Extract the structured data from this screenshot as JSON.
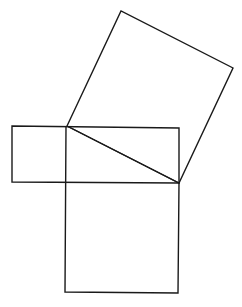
{
  "diagram": {
    "type": "geometric-construction",
    "stroke_color": "#1a1a1a",
    "background": "#ffffff",
    "shapes": {
      "tilted_square": {
        "points": [
          [
            67,
            126
          ],
          [
            121,
            11
          ],
          [
            233,
            68
          ],
          [
            179,
            183
          ]
        ]
      },
      "horizontal_rectangle": {
        "points": [
          [
            12,
            126
          ],
          [
            179,
            128
          ],
          [
            179,
            183
          ],
          [
            12,
            182
          ]
        ]
      },
      "lower_square": {
        "points": [
          [
            66,
            126
          ],
          [
            65,
            292
          ],
          [
            178,
            293
          ],
          [
            179,
            183
          ]
        ]
      },
      "hypotenuse": {
        "points": [
          [
            67,
            126
          ],
          [
            179,
            183
          ]
        ]
      }
    }
  }
}
